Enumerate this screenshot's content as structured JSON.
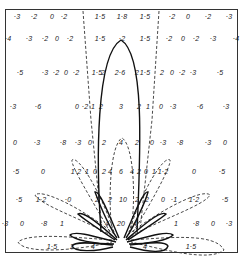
{
  "figure": {
    "rows": [
      {
        "y": 16,
        "cells": [
          {
            "x": 17,
            "t": "·3"
          },
          {
            "x": 34,
            "t": "·2"
          },
          {
            "x": 52,
            "t": "0"
          },
          {
            "x": 64,
            "t": "·2"
          },
          {
            "x": 100,
            "t": "1·5"
          },
          {
            "x": 122,
            "t": "1·8"
          },
          {
            "x": 145,
            "t": "1·5"
          },
          {
            "x": 172,
            "t": "·2"
          },
          {
            "x": 188,
            "t": "0"
          },
          {
            "x": 208,
            "t": "·2"
          },
          {
            "x": 229,
            "t": "·3"
          }
        ]
      },
      {
        "y": 38,
        "cells": [
          {
            "x": 8,
            "t": "·4"
          },
          {
            "x": 29,
            "t": "·3"
          },
          {
            "x": 45,
            "t": "·2"
          },
          {
            "x": 57,
            "t": "0"
          },
          {
            "x": 70,
            "t": "·2"
          },
          {
            "x": 100,
            "t": "1·5"
          },
          {
            "x": 122,
            "t": "·2"
          },
          {
            "x": 145,
            "t": "1·5"
          },
          {
            "x": 169,
            "t": "·2"
          },
          {
            "x": 183,
            "t": "0"
          },
          {
            "x": 196,
            "t": "·2"
          },
          {
            "x": 213,
            "t": "·3"
          },
          {
            "x": 236,
            "t": "·4"
          }
        ]
      },
      {
        "y": 72,
        "cells": [
          {
            "x": 20,
            "t": "·5"
          },
          {
            "x": 45,
            "t": "·3"
          },
          {
            "x": 56,
            "t": "·2"
          },
          {
            "x": 66,
            "t": "0"
          },
          {
            "x": 76,
            "t": "·2"
          },
          {
            "x": 97,
            "t": "1·5"
          },
          {
            "x": 103,
            "t": "2"
          },
          {
            "x": 120,
            "t": "2·6"
          },
          {
            "x": 137,
            "t": "2"
          },
          {
            "x": 145,
            "t": "1·5"
          },
          {
            "x": 162,
            "t": "2"
          },
          {
            "x": 172,
            "t": "0"
          },
          {
            "x": 182,
            "t": "·2"
          },
          {
            "x": 193,
            "t": "·3"
          },
          {
            "x": 220,
            "t": "·5"
          }
        ]
      },
      {
        "y": 106,
        "cells": [
          {
            "x": 13,
            "t": "·3"
          },
          {
            "x": 38,
            "t": "·6"
          },
          {
            "x": 77,
            "t": "0"
          },
          {
            "x": 85,
            "t": "·2"
          },
          {
            "x": 93,
            "t": "1"
          },
          {
            "x": 101,
            "t": "2"
          },
          {
            "x": 121,
            "t": "3"
          },
          {
            "x": 139,
            "t": "2"
          },
          {
            "x": 148,
            "t": "1"
          },
          {
            "x": 161,
            "t": "0"
          },
          {
            "x": 173,
            "t": "·3"
          },
          {
            "x": 200,
            "t": "·6"
          },
          {
            "x": 226,
            "t": "·3"
          }
        ]
      },
      {
        "y": 142,
        "cells": [
          {
            "x": 15,
            "t": "0"
          },
          {
            "x": 37,
            "t": "·3"
          },
          {
            "x": 63,
            "t": "·8"
          },
          {
            "x": 78,
            "t": "·3"
          },
          {
            "x": 90,
            "t": "0"
          },
          {
            "x": 104,
            "t": "2"
          },
          {
            "x": 121,
            "t": "4"
          },
          {
            "x": 137,
            "t": "2"
          },
          {
            "x": 152,
            "t": "0"
          },
          {
            "x": 163,
            "t": "·3"
          },
          {
            "x": 180,
            "t": "·8"
          },
          {
            "x": 208,
            "t": "·3"
          },
          {
            "x": 225,
            "t": "0"
          }
        ]
      },
      {
        "y": 171,
        "cells": [
          {
            "x": 16,
            "t": "·5"
          },
          {
            "x": 43,
            "t": "0"
          },
          {
            "x": 76,
            "t": "1·2"
          },
          {
            "x": 87,
            "t": "1"
          },
          {
            "x": 95,
            "t": "0"
          },
          {
            "x": 104,
            "t": "2"
          },
          {
            "x": 110,
            "t": "4"
          },
          {
            "x": 121,
            "t": "6"
          },
          {
            "x": 132,
            "t": "4"
          },
          {
            "x": 139,
            "t": "2"
          },
          {
            "x": 146,
            "t": "0"
          },
          {
            "x": 154,
            "t": "1"
          },
          {
            "x": 163,
            "t": "1·2"
          },
          {
            "x": 194,
            "t": "0"
          },
          {
            "x": 222,
            "t": "·5"
          }
        ]
      },
      {
        "y": 199,
        "cells": [
          {
            "x": 19,
            "t": "·5"
          },
          {
            "x": 41,
            "t": "1·2"
          },
          {
            "x": 68,
            "t": "·0"
          },
          {
            "x": 97,
            "t": "2"
          },
          {
            "x": 110,
            "t": "2"
          },
          {
            "x": 123,
            "t": "10"
          },
          {
            "x": 137,
            "t": "2"
          },
          {
            "x": 147,
            "t": "2"
          },
          {
            "x": 163,
            "t": "0"
          },
          {
            "x": 174,
            "t": "·1"
          },
          {
            "x": 194,
            "t": "1·2"
          },
          {
            "x": 225,
            "t": "·5"
          }
        ]
      },
      {
        "y": 223,
        "cells": [
          {
            "x": 5,
            "t": "·3"
          },
          {
            "x": 22,
            "t": "0"
          },
          {
            "x": 44,
            "t": "·8"
          },
          {
            "x": 62,
            "t": "1"
          },
          {
            "x": 107,
            "t": "4"
          },
          {
            "x": 121,
            "t": "20"
          },
          {
            "x": 135,
            "t": "4"
          },
          {
            "x": 176,
            "t": "1"
          },
          {
            "x": 196,
            "t": "·8"
          },
          {
            "x": 213,
            "t": "0"
          },
          {
            "x": 229,
            "t": "·3"
          }
        ]
      },
      {
        "y": 246,
        "cells": [
          {
            "x": 52,
            "t": "1·5"
          },
          {
            "x": 72,
            "t": "2"
          },
          {
            "x": 93,
            "t": "4"
          },
          {
            "x": 145,
            "t": "4"
          },
          {
            "x": 191,
            "t": "1·5"
          }
        ]
      }
    ],
    "colors": {
      "line": "#1a1a1a",
      "dash": "#333333",
      "background": "#ffffff",
      "frame": "#333333"
    }
  }
}
